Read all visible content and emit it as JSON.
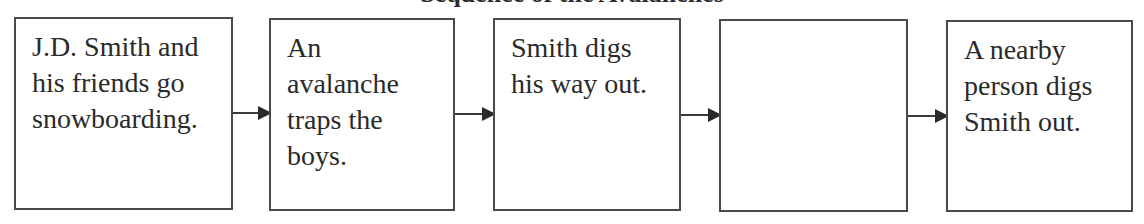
{
  "diagram": {
    "title": "Sequence of the Avalanches",
    "type": "flowchart",
    "direction": "left-to-right",
    "boxes": [
      {
        "id": 1,
        "text": "J.D. Smith and\nhis friends go\nsnowboarding."
      },
      {
        "id": 2,
        "text": "An\navalanche\ntraps the\nboys."
      },
      {
        "id": 3,
        "text": "Smith digs\nhis way out."
      },
      {
        "id": 4,
        "text": ""
      },
      {
        "id": 5,
        "text": "A nearby\nperson digs\nSmith out."
      }
    ],
    "arrows": [
      {
        "from": 1,
        "to": 2
      },
      {
        "from": 2,
        "to": 3
      },
      {
        "from": 3,
        "to": 4
      },
      {
        "from": 4,
        "to": 5
      }
    ]
  }
}
